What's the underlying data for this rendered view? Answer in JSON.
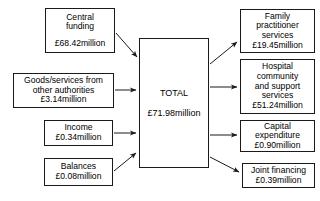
{
  "diagram": {
    "type": "flow-diagram",
    "currency_symbol": "£",
    "unit": "million",
    "line_color": "#1a1a1a",
    "background_color": "#ffffff",
    "inputs": [
      {
        "id": "central-funding",
        "lines": [
          "Central",
          "funding"
        ],
        "amount": "£68.42million",
        "value": 68.42
      },
      {
        "id": "goods-services",
        "lines": [
          "Goods/services from",
          "other authorities"
        ],
        "amount": "£3.14million",
        "value": 3.14
      },
      {
        "id": "income",
        "lines": [
          "Income"
        ],
        "amount": "£0.34million",
        "value": 0.34
      },
      {
        "id": "balances",
        "lines": [
          "Balances"
        ],
        "amount": "£0.08million",
        "value": 0.08
      }
    ],
    "total": {
      "id": "total",
      "label": "TOTAL",
      "amount": "£71.98million",
      "value": 71.98
    },
    "outputs": [
      {
        "id": "family-practitioner",
        "lines": [
          "Family",
          "practitioner",
          "services"
        ],
        "amount": "£19.45million",
        "value": 19.45
      },
      {
        "id": "hospital-community",
        "lines": [
          "Hospital",
          "community",
          "and support",
          "services"
        ],
        "amount": "£51.24million",
        "value": 51.24
      },
      {
        "id": "capital-expenditure",
        "lines": [
          "Capital",
          "expenditure"
        ],
        "amount": "£0.90million",
        "value": 0.9
      },
      {
        "id": "joint-financing",
        "lines": [
          "Joint financing"
        ],
        "amount": "£0.39million",
        "value": 0.39
      }
    ]
  }
}
